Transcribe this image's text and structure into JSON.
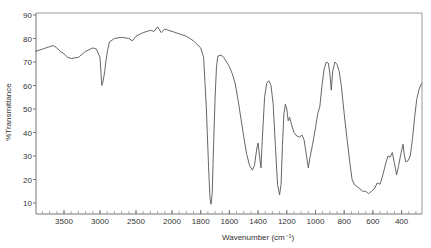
{
  "chart_data": {
    "type": "line",
    "title": "",
    "xlabel": "Wavenumber (cm⁻¹)",
    "ylabel": "%Transmittance",
    "xlim": [
      3900,
      230
    ],
    "ylim": [
      5,
      90
    ],
    "x_axis_reversed": true,
    "x_axis_scale_break": 2000,
    "grid": false,
    "legend": null,
    "xticks": [
      3500,
      3000,
      2500,
      2000,
      1800,
      1600,
      1400,
      1200,
      1000,
      800,
      600,
      400
    ],
    "yticks": [
      10,
      20,
      30,
      40,
      50,
      60,
      70,
      80,
      90
    ],
    "series": [
      {
        "name": "IR spectrum",
        "color": "#555555",
        "points": [
          [
            3900,
            74.5
          ],
          [
            3800,
            75.5
          ],
          [
            3700,
            76.5
          ],
          [
            3650,
            77.0
          ],
          [
            3600,
            76.0
          ],
          [
            3550,
            74.5
          ],
          [
            3500,
            73.5
          ],
          [
            3450,
            72.0
          ],
          [
            3400,
            71.5
          ],
          [
            3300,
            72.0
          ],
          [
            3200,
            74.5
          ],
          [
            3100,
            76.0
          ],
          [
            3050,
            75.5
          ],
          [
            3000,
            72.0
          ],
          [
            2975,
            60.0
          ],
          [
            2955,
            62.0
          ],
          [
            2935,
            66.0
          ],
          [
            2920,
            70.0
          ],
          [
            2900,
            74.0
          ],
          [
            2870,
            78.5
          ],
          [
            2800,
            80.0
          ],
          [
            2700,
            80.5
          ],
          [
            2600,
            80.0
          ],
          [
            2550,
            79.0
          ],
          [
            2500,
            81.0
          ],
          [
            2400,
            82.5
          ],
          [
            2300,
            83.5
          ],
          [
            2250,
            83.0
          ],
          [
            2200,
            85.0
          ],
          [
            2150,
            82.5
          ],
          [
            2100,
            84.0
          ],
          [
            2050,
            83.5
          ],
          [
            2000,
            83.0
          ],
          [
            1950,
            82.0
          ],
          [
            1900,
            81.0
          ],
          [
            1850,
            79.0
          ],
          [
            1800,
            76.0
          ],
          [
            1780,
            72.0
          ],
          [
            1760,
            50.0
          ],
          [
            1745,
            25.0
          ],
          [
            1735,
            12.0
          ],
          [
            1728,
            9.5
          ],
          [
            1720,
            14.0
          ],
          [
            1710,
            35.0
          ],
          [
            1700,
            55.0
          ],
          [
            1690,
            68.0
          ],
          [
            1680,
            72.5
          ],
          [
            1660,
            73.0
          ],
          [
            1640,
            72.0
          ],
          [
            1620,
            70.0
          ],
          [
            1600,
            68.0
          ],
          [
            1580,
            65.0
          ],
          [
            1560,
            61.0
          ],
          [
            1540,
            54.0
          ],
          [
            1520,
            46.0
          ],
          [
            1500,
            38.0
          ],
          [
            1480,
            31.0
          ],
          [
            1460,
            26.0
          ],
          [
            1440,
            24.0
          ],
          [
            1425,
            26.0
          ],
          [
            1410,
            33.0
          ],
          [
            1400,
            35.5
          ],
          [
            1390,
            30.0
          ],
          [
            1380,
            25.0
          ],
          [
            1370,
            38.0
          ],
          [
            1355,
            55.0
          ],
          [
            1340,
            61.0
          ],
          [
            1325,
            62.0
          ],
          [
            1310,
            60.0
          ],
          [
            1295,
            52.0
          ],
          [
            1280,
            35.0
          ],
          [
            1265,
            18.0
          ],
          [
            1250,
            13.5
          ],
          [
            1240,
            18.0
          ],
          [
            1230,
            35.0
          ],
          [
            1220,
            48.0
          ],
          [
            1210,
            52.0
          ],
          [
            1200,
            50.0
          ],
          [
            1190,
            45.0
          ],
          [
            1180,
            46.5
          ],
          [
            1170,
            44.0
          ],
          [
            1150,
            40.0
          ],
          [
            1130,
            38.5
          ],
          [
            1110,
            38.0
          ],
          [
            1095,
            39.0
          ],
          [
            1080,
            37.0
          ],
          [
            1065,
            31.0
          ],
          [
            1050,
            25.0
          ],
          [
            1040,
            29.0
          ],
          [
            1020,
            35.0
          ],
          [
            1000,
            42.0
          ],
          [
            985,
            48.0
          ],
          [
            970,
            51.0
          ],
          [
            955,
            60.0
          ],
          [
            940,
            67.0
          ],
          [
            925,
            70.0
          ],
          [
            910,
            69.5
          ],
          [
            900,
            65.0
          ],
          [
            890,
            58.0
          ],
          [
            880,
            66.0
          ],
          [
            865,
            70.0
          ],
          [
            850,
            69.0
          ],
          [
            835,
            66.0
          ],
          [
            820,
            60.0
          ],
          [
            800,
            48.0
          ],
          [
            780,
            37.0
          ],
          [
            760,
            27.0
          ],
          [
            745,
            20.0
          ],
          [
            730,
            18.0
          ],
          [
            710,
            17.0
          ],
          [
            690,
            16.0
          ],
          [
            670,
            15.0
          ],
          [
            650,
            15.0
          ],
          [
            630,
            14.0
          ],
          [
            610,
            15.0
          ],
          [
            590,
            16.0
          ],
          [
            570,
            18.5
          ],
          [
            550,
            18.0
          ],
          [
            530,
            22.0
          ],
          [
            510,
            27.0
          ],
          [
            495,
            30.0
          ],
          [
            480,
            29.5
          ],
          [
            465,
            31.5
          ],
          [
            450,
            27.0
          ],
          [
            435,
            22.0
          ],
          [
            420,
            26.0
          ],
          [
            405,
            31.0
          ],
          [
            390,
            35.0
          ],
          [
            380,
            30.0
          ],
          [
            370,
            27.5
          ],
          [
            355,
            28.0
          ],
          [
            340,
            30.0
          ],
          [
            325,
            37.0
          ],
          [
            310,
            46.0
          ],
          [
            295,
            54.0
          ],
          [
            280,
            58.0
          ],
          [
            265,
            60.5
          ],
          [
            255,
            61.0
          ]
        ]
      }
    ]
  },
  "labels": {
    "ylabel": "%Transmittance",
    "xlabel": "Wavenumber (cm⁻¹)"
  }
}
